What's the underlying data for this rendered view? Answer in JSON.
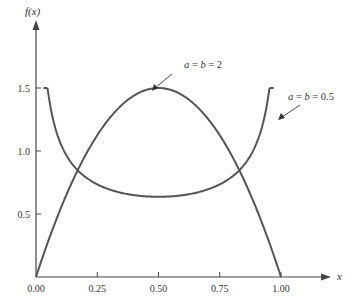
{
  "chart_data": {
    "type": "line",
    "title": "",
    "xlabel": "x",
    "ylabel": "f(x)",
    "xlim": [
      0,
      1
    ],
    "ylim": [
      0,
      1.5
    ],
    "x_ticks": [
      "0.00",
      "0.25",
      "0.50",
      "0.75",
      "1.00"
    ],
    "y_ticks": [
      "0.5",
      "1.0",
      "1.5"
    ],
    "grid": false,
    "legend": "none (curves annotated with arrows)",
    "series": [
      {
        "name": "a = b = 2",
        "x": [
          0.0,
          0.1,
          0.2,
          0.25,
          0.3,
          0.4,
          0.5,
          0.6,
          0.7,
          0.75,
          0.8,
          0.9,
          1.0
        ],
        "values": [
          0.0,
          0.54,
          0.96,
          1.125,
          1.26,
          1.44,
          1.5,
          1.44,
          1.26,
          1.125,
          0.96,
          0.54,
          0.0
        ]
      },
      {
        "name": "a = b = 0.5",
        "x": [
          0.02,
          0.05,
          0.1,
          0.2,
          0.25,
          0.3,
          0.4,
          0.5,
          0.6,
          0.7,
          0.75,
          0.8,
          0.9,
          0.95,
          0.98
        ],
        "values": [
          1.5,
          1.46,
          1.06,
          0.8,
          0.735,
          0.695,
          0.65,
          0.637,
          0.65,
          0.695,
          0.735,
          0.8,
          1.06,
          1.46,
          1.5
        ]
      }
    ],
    "annotations": [
      {
        "text": "a = b = 2",
        "points_to": {
          "x": 0.55,
          "y": 1.47
        }
      },
      {
        "text": "a = b = 0.5",
        "points_to": {
          "x": 0.97,
          "y": 1.2
        }
      }
    ]
  },
  "labels": {
    "x_axis": "x",
    "y_axis": "f(x)",
    "annot_ab2": "a = b = 2",
    "annot_ab05": "a = b = 0.5"
  }
}
